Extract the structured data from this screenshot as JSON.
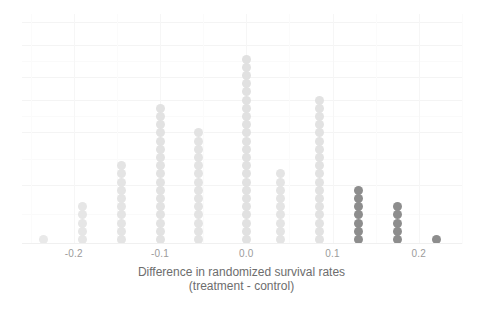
{
  "chart_data": {
    "type": "bar",
    "subtype": "stacked-dot-plot",
    "title": "",
    "xlabel": "Difference in randomized survival rates\n(treatment - control)",
    "xlabel_line1": "Difference in randomized survival rates",
    "xlabel_line2": "(treatment - control)",
    "ylabel": "",
    "xlim": [
      -0.26,
      0.25
    ],
    "ylim": [
      0,
      26
    ],
    "grid": true,
    "legend": "none",
    "xticks": [
      -0.2,
      -0.1,
      0.0,
      0.1,
      0.2
    ],
    "xticklabels": [
      "-0.2",
      "-0.1",
      "0.0",
      "0.1",
      "0.2"
    ],
    "categories": [
      -0.235,
      -0.19,
      -0.145,
      -0.1,
      -0.055,
      0.0,
      0.04,
      0.085,
      0.13,
      0.175,
      0.22
    ],
    "values": [
      1,
      5,
      10,
      17,
      14,
      23,
      9,
      18,
      7,
      5,
      1
    ],
    "series": [
      {
        "name": "observed-differences",
        "values": [
          1,
          5,
          10,
          17,
          14,
          23,
          9,
          18,
          7,
          5,
          1
        ],
        "point_colors": [
          "#e9e9e9",
          "#e6e6e6",
          "#e4e4e4",
          "#e2e2e2",
          "#e3e3e3",
          "#e1e1e1",
          "#e4e4e4",
          "#e2e2e2",
          "#8d8d8d",
          "#8d8d8d",
          "#8d8d8d"
        ]
      }
    ],
    "highlight_threshold": 0.12,
    "highlight_color": "#8d8d8d",
    "base_color": "#e3e3e3",
    "background_color": "#ffffff",
    "gridline_color": "#f4f4f4",
    "tick_label_color": "#9b9b9b",
    "axis_title_color": "#6d6d6d",
    "annotations": []
  },
  "axis": {
    "tick_labels": [
      "-0.2",
      "-0.1",
      "0.0",
      "0.1",
      "0.2"
    ],
    "title_line1": "Difference in randomized survival rates",
    "title_line2": "(treatment - control)"
  }
}
